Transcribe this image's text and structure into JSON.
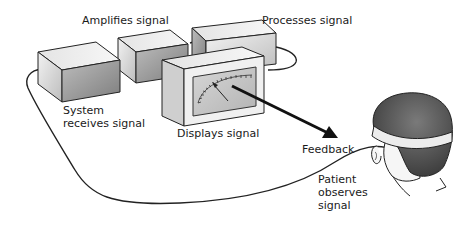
{
  "labels": {
    "amplifies": "Amplifies signal",
    "processes": "Processes signal",
    "system_line1": "System",
    "system_line2": "receives signal",
    "displays": "Displays signal",
    "feedback": "Feedback",
    "patient_line1": "Patient",
    "patient_line2": "observes",
    "patient_line3": "signal"
  },
  "components": [
    {
      "id": "receiver-box",
      "role": "System receives signal"
    },
    {
      "id": "amplifier-box",
      "role": "Amplifies signal"
    },
    {
      "id": "processor-box",
      "role": "Processes signal"
    },
    {
      "id": "display-box",
      "role": "Displays signal",
      "contains": "analog meter with needle"
    },
    {
      "id": "patient",
      "role": "Patient observes signal",
      "wears": "headband sensor"
    }
  ],
  "connections": [
    {
      "from": "patient",
      "to": "receiver-box",
      "type": "cable"
    },
    {
      "from": "receiver-box",
      "to": "amplifier-box",
      "type": "cable"
    },
    {
      "from": "amplifier-box",
      "to": "processor-box",
      "type": "cable"
    },
    {
      "from": "processor-box",
      "to": "display-box",
      "type": "cable loop"
    },
    {
      "from": "display-box",
      "to": "patient",
      "type": "arrow",
      "label": "Feedback"
    }
  ],
  "colors": {
    "box_top": "#ededed",
    "box_front": "#d8d8d8",
    "box_side": "#9a9a9a",
    "meter_face": "#c9c9c9",
    "outline": "#222222",
    "hair": "#5a5a5a",
    "headband": "#e6e6e6",
    "skin": "#f4f4f4"
  }
}
